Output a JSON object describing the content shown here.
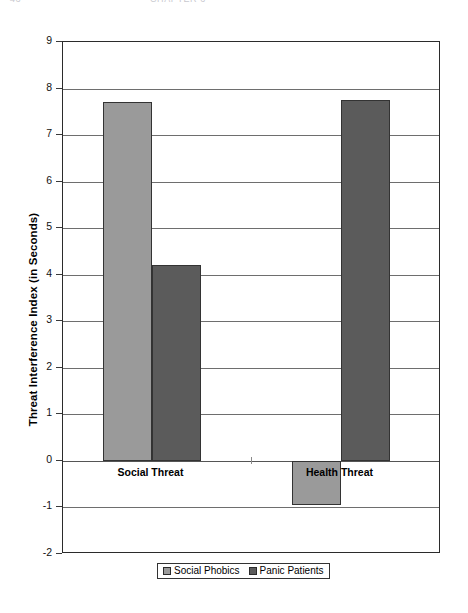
{
  "header": {
    "clipped_left": "46",
    "clipped_center": "CHAPTER 6"
  },
  "legend": {
    "position": "bottom",
    "entries": [
      {
        "label": "Social Phobics",
        "swatch": "series-a",
        "color": "#9a9a9a"
      },
      {
        "label": "Panic Patients",
        "swatch": "series-b",
        "color": "#5b5b5b"
      }
    ]
  },
  "axis": {
    "y_title": "Threat Interference Index (in Seconds)",
    "y_ticks": [
      "9",
      "8",
      "7",
      "6",
      "5",
      "4",
      "3",
      "2",
      "1",
      "0",
      "-1",
      "-2"
    ]
  },
  "categories_display": [
    {
      "label": "Social Threat"
    },
    {
      "label": "Health Threat"
    }
  ],
  "chart_data": {
    "type": "bar",
    "title": "",
    "subtitle": "",
    "xlabel": "",
    "ylabel": "Threat Interference Index (in Seconds)",
    "categories": [
      "Social Threat",
      "Health Threat"
    ],
    "series": [
      {
        "name": "Social Phobics",
        "color": "#9a9a9a",
        "values": [
          7.72,
          -0.95
        ]
      },
      {
        "name": "Panic Patients",
        "color": "#5b5b5b",
        "values": [
          4.2,
          7.75
        ]
      }
    ],
    "ylim": [
      -2,
      9
    ],
    "ytick_step": 1,
    "grid": true,
    "grid_axis": "y",
    "legend_position": "bottom",
    "zero_line": 0,
    "annotations": []
  }
}
